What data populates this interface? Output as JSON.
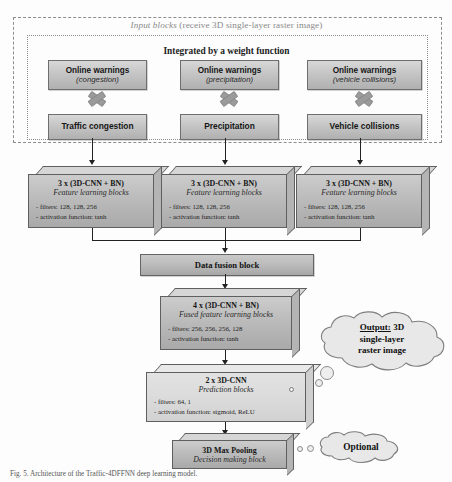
{
  "figure": {
    "input_section": {
      "frame_title_italic": "Input blocks",
      "frame_title_rest": " (receive 3D single-layer raster image)",
      "integration_label": "Integrated by a weight function",
      "columns": [
        {
          "warning_title": "Online warnings",
          "warning_subtitle": "(congestion)",
          "operator": "multiply-cross",
          "source_label": "Traffic congestion"
        },
        {
          "warning_title": "Online warnings",
          "warning_subtitle": "(precipitation)",
          "operator": "multiply-cross",
          "source_label": "Precipitation"
        },
        {
          "warning_title": "Online warnings",
          "warning_subtitle": "(vehicle collisions)",
          "operator": "multiply-cross",
          "source_label": "Vehicle collisions"
        }
      ]
    },
    "feature_blocks": [
      {
        "title": "3 x (3D-CNN + BN)",
        "subtitle": "Feature learning blocks",
        "line1": "- filters: 128, 128, 256",
        "line2": "- activation function: tanh"
      },
      {
        "title": "3 x (3D-CNN + BN)",
        "subtitle": "Feature learning blocks",
        "line1": "- filters: 128, 128, 256",
        "line2": "- activation function: tanh"
      },
      {
        "title": "3 x (3D-CNN + BN)",
        "subtitle": "Feature learning blocks",
        "line1": "- filters: 128, 128, 256",
        "line2": "- activation function: tanh"
      }
    ],
    "fusion_block": {
      "label": "Data fusion block"
    },
    "fused_block": {
      "title": "4 x (3D-CNN + BN)",
      "subtitle": "Fused feature learning blocks",
      "line1": "- filters: 256, 256, 256, 128",
      "line2": "- activation function: tanh"
    },
    "prediction_block": {
      "title": "2 x 3D-CNN",
      "subtitle": "Prediction blocks",
      "line1": "- filters: 64, 1",
      "line2": "- activation function: sigmoid, ReLU"
    },
    "pooling_block": {
      "title": "3D Max Pooling",
      "subtitle": "Decision making block"
    },
    "output_cloud": {
      "line1_underlined": "Output:",
      "line1_rest": " 3D",
      "line2": "single-layer",
      "line3": "raster image"
    },
    "optional_cloud": {
      "label": "Optional"
    },
    "caption": "Fig. 5.  Architecture of the Traffic-4DFFNN deep learning model."
  },
  "colors": {
    "box_face": "#bdbdbd",
    "box_top": "#d6d6d6",
    "box_side": "#b4b4b4",
    "light_box_face": "#dcdcdc",
    "tile_face": "#c6c6c6",
    "frame_border": "#8d8d8d",
    "connector": "#222222",
    "cloud_fill": "#e8e8e8",
    "cross_glyph": "#9b9b9b"
  }
}
